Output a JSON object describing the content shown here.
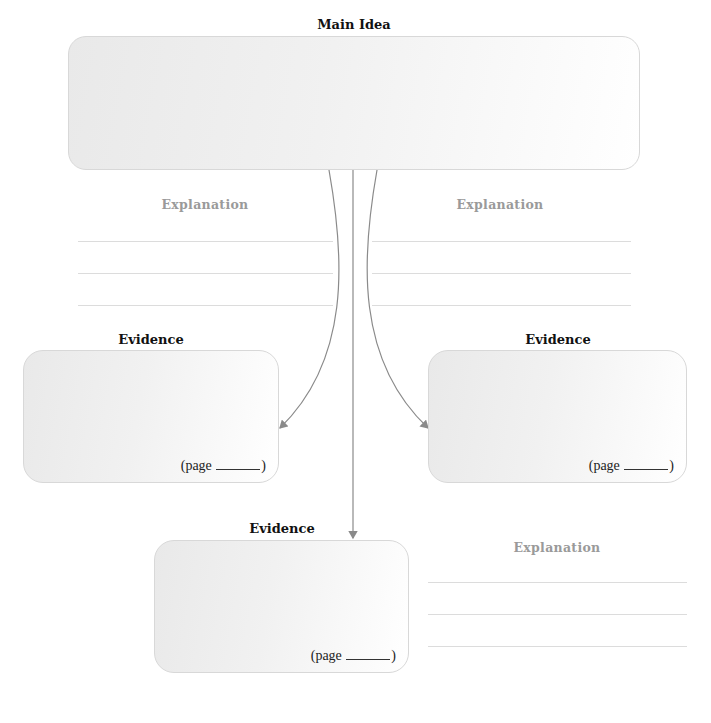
{
  "main_idea": {
    "title": "Main Idea"
  },
  "explanations": [
    {
      "label": "Explanation"
    },
    {
      "label": "Explanation"
    },
    {
      "label": "Explanation"
    }
  ],
  "evidence": [
    {
      "title": "Evidence",
      "page_label": "(page",
      "page_close": ")"
    },
    {
      "title": "Evidence",
      "page_label": "(page",
      "page_close": ")"
    },
    {
      "title": "Evidence",
      "page_label": "(page",
      "page_close": ")"
    }
  ],
  "colors": {
    "connector": "#8a8a8a",
    "rule_line": "#dcdcdc",
    "explanation_text": "#9a9a9a"
  }
}
